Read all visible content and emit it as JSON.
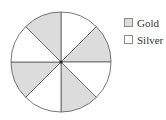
{
  "chart_data": {
    "type": "pie",
    "title": "",
    "slice_count": 8,
    "start_angle_deg": 0,
    "direction": "clockwise",
    "slices": [
      {
        "index": 0,
        "category": "Silver",
        "value": 1
      },
      {
        "index": 1,
        "category": "Gold",
        "value": 1
      },
      {
        "index": 2,
        "category": "Silver",
        "value": 1
      },
      {
        "index": 3,
        "category": "Gold",
        "value": 1
      },
      {
        "index": 4,
        "category": "Silver",
        "value": 1
      },
      {
        "index": 5,
        "category": "Gold",
        "value": 1
      },
      {
        "index": 6,
        "category": "Silver",
        "value": 1
      },
      {
        "index": 7,
        "category": "Gold",
        "value": 1
      }
    ],
    "categories": [
      "Gold",
      "Silver"
    ],
    "values": [
      4,
      4
    ],
    "legend": {
      "position": "right",
      "entries": [
        "Gold",
        "Silver"
      ]
    }
  },
  "legend": {
    "items": [
      {
        "label": "Gold",
        "color": "#dcdcdc"
      },
      {
        "label": "Silver",
        "color": "#ffffff"
      }
    ]
  },
  "colors": {
    "gold": "#dcdcdc",
    "silver": "#ffffff",
    "stroke": "#555555"
  }
}
